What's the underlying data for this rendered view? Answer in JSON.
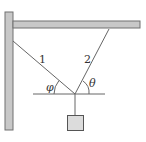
{
  "diagram": {
    "rope_labels": {
      "rope1": "1",
      "rope2": "2"
    },
    "angle_labels": {
      "left": "φ",
      "right": "θ"
    },
    "colors": {
      "support_fill": "#c8c8c8",
      "support_stroke": "#707070",
      "rope": "#666666",
      "mass_fill": "#dcdcdc",
      "mass_stroke": "#555555"
    }
  }
}
